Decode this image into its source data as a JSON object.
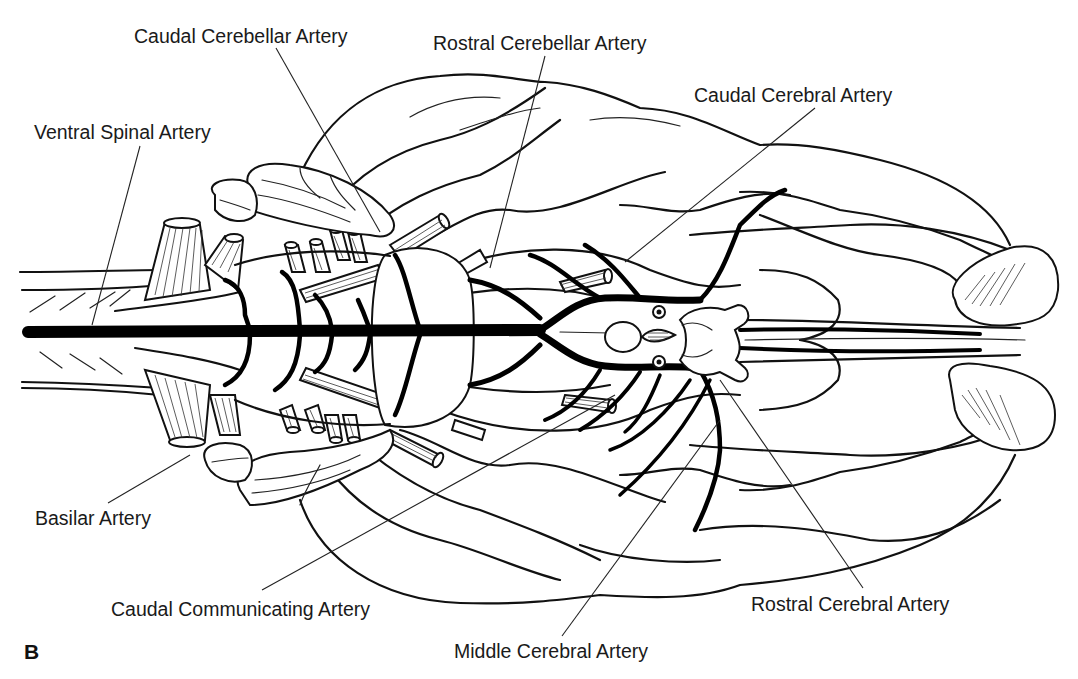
{
  "figure": {
    "panel_letter": "B",
    "colors": {
      "line": "#111111",
      "background": "#ffffff",
      "text": "#1a1a1a"
    }
  },
  "labels": [
    {
      "id": "caudal-cerebellar-artery",
      "text": "Caudal Cerebellar Artery",
      "x": 134,
      "y": 43,
      "leader": [
        [
          276,
          48
        ],
        [
          380,
          232
        ]
      ]
    },
    {
      "id": "rostral-cerebellar-artery",
      "text": "Rostral Cerebellar Artery",
      "x": 433,
      "y": 50,
      "leader": [
        [
          545,
          56
        ],
        [
          490,
          268
        ]
      ]
    },
    {
      "id": "caudal-cerebral-artery",
      "text": "Caudal Cerebral Artery",
      "x": 694,
      "y": 102,
      "leader": [
        [
          815,
          108
        ],
        [
          625,
          262
        ]
      ]
    },
    {
      "id": "ventral-spinal-artery",
      "text": "Ventral Spinal Artery",
      "x": 34,
      "y": 139,
      "leader": [
        [
          140,
          146
        ],
        [
          92,
          325
        ]
      ]
    },
    {
      "id": "basilar-artery",
      "text": "Basilar Artery",
      "x": 35,
      "y": 525,
      "leader": [
        [
          108,
          503
        ],
        [
          190,
          455
        ]
      ]
    },
    {
      "id": "caudal-communicating-artery",
      "text": "Caudal Communicating Artery",
      "x": 111,
      "y": 616,
      "leader": [
        [
          262,
          590
        ],
        [
          615,
          395
        ]
      ]
    },
    {
      "id": "rostral-cerebral-artery",
      "text": "Rostral Cerebral Artery",
      "x": 751,
      "y": 611,
      "leader": [
        [
          863,
          588
        ],
        [
          720,
          380
        ]
      ]
    },
    {
      "id": "middle-cerebral-artery",
      "text": "Middle Cerebral Artery",
      "x": 454,
      "y": 658,
      "leader": [
        [
          562,
          636
        ],
        [
          720,
          420
        ]
      ]
    }
  ]
}
